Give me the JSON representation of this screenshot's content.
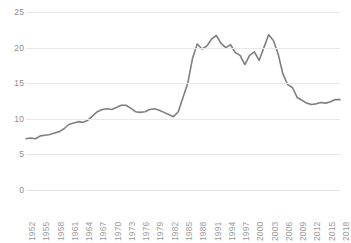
{
  "chart_data": {
    "type": "line",
    "title": "",
    "subtitle": "",
    "xlabel": "",
    "ylabel": "",
    "xlim": [
      1952,
      2018
    ],
    "ylim": [
      0,
      25
    ],
    "y_ticks": [
      0,
      5,
      10,
      15,
      20,
      25
    ],
    "x_tick_labels": [
      "1952",
      "1955",
      "1958",
      "1961",
      "1964",
      "1967",
      "1970",
      "1973",
      "1976",
      "1979",
      "1982",
      "1985",
      "1988",
      "1991",
      "1994",
      "1997",
      "2000",
      "2003",
      "2006",
      "2009",
      "2012",
      "2015",
      "2018"
    ],
    "x_tick_step": 3,
    "grid": "horizontal",
    "legend": "none",
    "series": [
      {
        "name": "series-1",
        "color": "#7f7f7f",
        "x": [
          1952,
          1953,
          1954,
          1955,
          1956,
          1957,
          1958,
          1959,
          1960,
          1961,
          1962,
          1963,
          1964,
          1965,
          1966,
          1967,
          1968,
          1969,
          1970,
          1971,
          1972,
          1973,
          1974,
          1975,
          1976,
          1977,
          1978,
          1979,
          1980,
          1981,
          1982,
          1983,
          1984,
          1985,
          1986,
          1987,
          1988,
          1989,
          1990,
          1991,
          1992,
          1993,
          1994,
          1995,
          1996,
          1997,
          1998,
          1999,
          2000,
          2001,
          2002,
          2003,
          2004,
          2005,
          2006,
          2007,
          2008,
          2009,
          2010,
          2011,
          2012,
          2013,
          2014,
          2015,
          2016,
          2017,
          2018
        ],
        "values": [
          7.2,
          7.3,
          7.2,
          7.6,
          7.7,
          7.8,
          8.0,
          8.2,
          8.6,
          9.2,
          9.4,
          9.6,
          9.5,
          9.8,
          10.4,
          11.0,
          11.3,
          11.4,
          11.3,
          11.6,
          11.9,
          11.9,
          11.5,
          11.0,
          10.9,
          11.0,
          11.3,
          11.4,
          11.2,
          10.9,
          10.6,
          10.3,
          11.0,
          13.0,
          15.0,
          18.5,
          20.5,
          19.8,
          20.2,
          21.2,
          21.7,
          20.6,
          20.0,
          20.4,
          19.3,
          18.9,
          17.6,
          18.9,
          19.4,
          18.2,
          20.0,
          21.8,
          21.0,
          19.1,
          16.3,
          14.8,
          14.4,
          13.0,
          12.6,
          12.2,
          12.0,
          12.1,
          12.3,
          12.2,
          12.4,
          12.7,
          12.7
        ]
      }
    ]
  }
}
